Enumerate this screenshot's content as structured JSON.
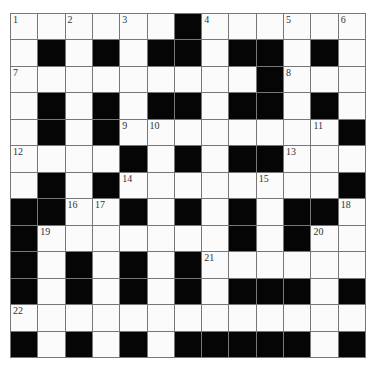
{
  "puzzle": {
    "rows": 13,
    "cols": 13,
    "colors": {
      "black": "#050505",
      "white": "#fbfbfb",
      "gridline": "#777777"
    },
    "layout": [
      "WWWWWWBWWWWWW",
      "WBWBWBBWBBWBW",
      "WWWWWWWWWBWWW",
      "WBWBWBBWBBWBW",
      "WBWBWWWWWWWWB",
      "WWWWBWBWBBWWW",
      "WBWBWWWWWWWWB",
      "BBWWBWBWBWBBW",
      "BWWWWWWWBWBWW",
      "BWBWBWBWWWWWW",
      "BWBWBWBWBBBWB",
      "WWWWWWWWWWWWW",
      "BWBWBWBBBBBWB"
    ],
    "numbers": [
      {
        "row": 0,
        "col": 0,
        "n": "1"
      },
      {
        "row": 0,
        "col": 2,
        "n": "2"
      },
      {
        "row": 0,
        "col": 4,
        "n": "3"
      },
      {
        "row": 0,
        "col": 7,
        "n": "4"
      },
      {
        "row": 0,
        "col": 10,
        "n": "5"
      },
      {
        "row": 0,
        "col": 12,
        "n": "6"
      },
      {
        "row": 2,
        "col": 0,
        "n": "7"
      },
      {
        "row": 2,
        "col": 10,
        "n": "8"
      },
      {
        "row": 4,
        "col": 4,
        "n": "9"
      },
      {
        "row": 4,
        "col": 5,
        "n": "10"
      },
      {
        "row": 4,
        "col": 11,
        "n": "11"
      },
      {
        "row": 5,
        "col": 0,
        "n": "12"
      },
      {
        "row": 5,
        "col": 10,
        "n": "13"
      },
      {
        "row": 6,
        "col": 4,
        "n": "14"
      },
      {
        "row": 6,
        "col": 9,
        "n": "15"
      },
      {
        "row": 7,
        "col": 2,
        "n": "16"
      },
      {
        "row": 7,
        "col": 3,
        "n": "17"
      },
      {
        "row": 7,
        "col": 12,
        "n": "18"
      },
      {
        "row": 8,
        "col": 1,
        "n": "19"
      },
      {
        "row": 8,
        "col": 11,
        "n": "20"
      },
      {
        "row": 9,
        "col": 7,
        "n": "21"
      },
      {
        "row": 11,
        "col": 0,
        "n": "22"
      }
    ]
  }
}
